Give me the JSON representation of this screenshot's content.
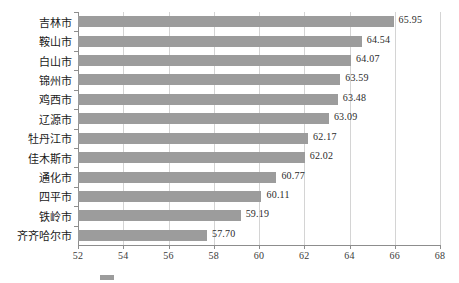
{
  "chart_data": {
    "type": "bar",
    "orientation": "horizontal",
    "title": "",
    "xlabel": "",
    "ylabel": "",
    "xlim": [
      52,
      68
    ],
    "xticks": [
      52,
      54,
      56,
      58,
      60,
      62,
      64,
      66,
      68
    ],
    "grid": "vertical",
    "legend_position": "bottom",
    "bar_color": "#9c9c9c",
    "categories": [
      "吉林市",
      "鞍山市",
      "白山市",
      "锦州市",
      "鸡西市",
      "辽源市",
      "牡丹江市",
      "佳木斯市",
      "通化市",
      "四平市",
      "铁岭市",
      "齐齐哈尔市"
    ],
    "values": [
      65.95,
      64.54,
      64.07,
      63.59,
      63.48,
      63.09,
      62.17,
      62.02,
      60.77,
      60.11,
      59.19,
      57.7
    ],
    "value_labels": [
      "65.95",
      "64.54",
      "64.07",
      "63.59",
      "63.48",
      "63.09",
      "62.17",
      "62.02",
      "60.77",
      "60.11",
      "59.19",
      "57.70"
    ],
    "xtick_labels": [
      "52",
      "54",
      "56",
      "58",
      "60",
      "62",
      "64",
      "66",
      "68"
    ]
  },
  "caption": {
    "text": ""
  }
}
